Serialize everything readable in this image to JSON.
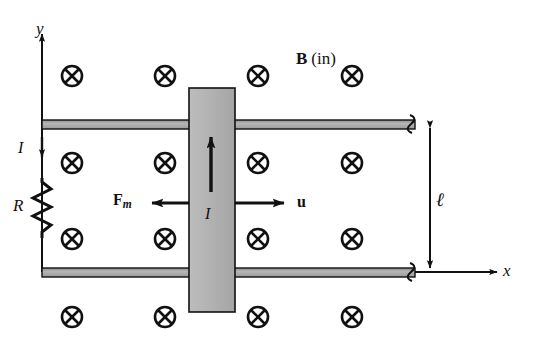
{
  "figure": {
    "background_color": "#ffffff",
    "ink_color": "#111111",
    "rail_fill_color": "#a8a8a8",
    "bar_fill_color": "#b0b0b0"
  },
  "labels": {
    "y_axis": "y",
    "x_axis": "x",
    "current_left": "I",
    "current_bar": "I",
    "resistor": "R",
    "length": "ℓ",
    "field_symbol": "B",
    "field_direction": "(in)",
    "force_symbol": "F",
    "force_subscript": "m",
    "velocity": "u"
  },
  "field": {
    "symbol_name": "x-in-circle-icon",
    "glyph": "⊗",
    "direction": "into-page",
    "rows_y": [
      76,
      163,
      239,
      317
    ],
    "cols_x": [
      72,
      165,
      258,
      352
    ],
    "radius": 10,
    "count": 16
  },
  "geometry": {
    "y_axis_x": 42,
    "y_axis_top": 30,
    "y_axis_bottom": 272,
    "x_axis_y": 272,
    "x_axis_right": 500,
    "top_rail_y": 124,
    "bottom_rail_y": 272,
    "rail_left_x": 42,
    "rail_right_x": 415,
    "rail_thickness": 8,
    "bar_left": 189,
    "bar_right": 235,
    "bar_top": 88,
    "bar_bottom": 312,
    "resistor_x": 42,
    "resistor_top": 178,
    "resistor_bottom": 238,
    "dimension_x": 430,
    "force_arrow_from": 189,
    "force_arrow_to": 146,
    "velocity_arrow_from": 235,
    "velocity_arrow_to": 290,
    "arrow_y": 203
  }
}
